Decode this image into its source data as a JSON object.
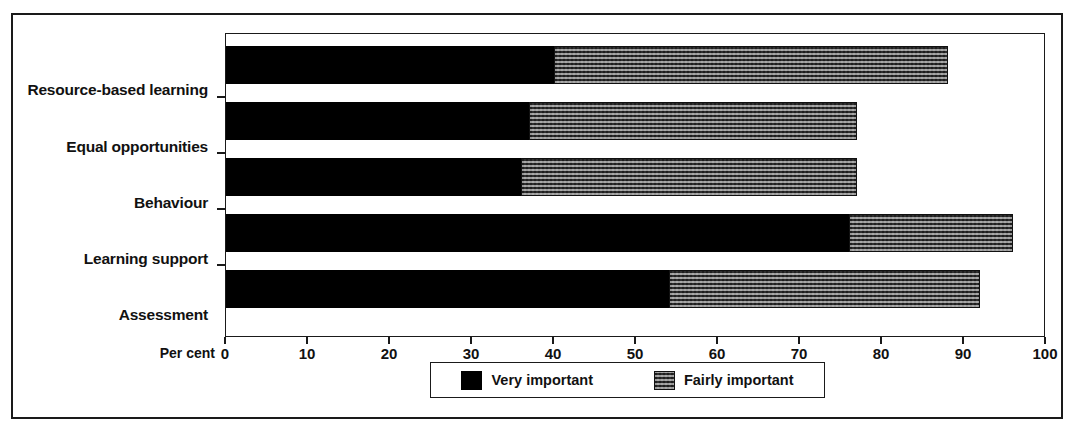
{
  "chart_data": {
    "type": "bar",
    "orientation": "horizontal",
    "stacked": true,
    "title": "",
    "subtitle": "",
    "xlabel": "Per cent",
    "ylabel": "",
    "xlim": [
      0,
      100
    ],
    "ylim": null,
    "grid": false,
    "legend_position": "bottom",
    "categories": [
      "Resource-based learning",
      "Equal opportunities",
      "Behaviour",
      "Learning support",
      "Assessment"
    ],
    "xticks": [
      0,
      10,
      20,
      30,
      40,
      50,
      60,
      70,
      80,
      90,
      100
    ],
    "xticklabels": [
      "0",
      "10",
      "20",
      "30",
      "40",
      "50",
      "60",
      "70",
      "80",
      "90",
      "100"
    ],
    "series": [
      {
        "name": "Very important",
        "fill": "solid-black",
        "color": "#000000",
        "values": [
          40,
          37,
          36,
          76,
          54
        ]
      },
      {
        "name": "Fairly important",
        "fill": "checkered-grey",
        "color": "#b9b9b9",
        "values": [
          48,
          40,
          41,
          20,
          38
        ]
      }
    ],
    "totals": [
      88,
      77,
      77,
      96,
      92
    ]
  },
  "axis": {
    "title": "Per cent"
  },
  "legend": {
    "entries": [
      {
        "label": "Very important",
        "swatch": "solid-black-swatch"
      },
      {
        "label": "Fairly important",
        "swatch": "checkered-grey-swatch"
      }
    ]
  },
  "colors": {
    "very_important": "#000000",
    "fairly_important": "#b9b9b9",
    "frame": "#1a1a1a",
    "text": "#111111",
    "background": "#ffffff"
  }
}
